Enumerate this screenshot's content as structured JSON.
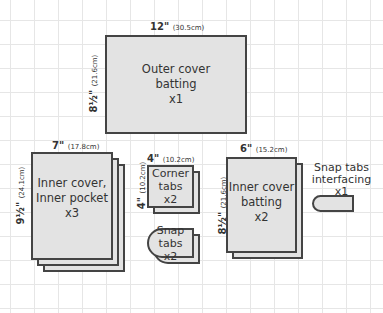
{
  "pieces": {
    "outer_cover": {
      "label_lines": [
        "Outer cover",
        "batting",
        "x1"
      ],
      "width": "12\"",
      "width_cm": "(30.5cm)",
      "height": "8½\"",
      "height_cm": "(21.6cm)"
    },
    "inner_cover": {
      "label_lines": [
        "Inner cover,",
        "Inner pocket",
        "x3"
      ],
      "width": "7\"",
      "width_cm": "(17.8cm)",
      "height": "9½\"",
      "height_cm": "(24.1cm)"
    },
    "corner_tabs": {
      "label_lines": [
        "Corner",
        "tabs",
        "x2"
      ],
      "width": "4\"",
      "width_cm": "(10.2cm)",
      "height": "4\"",
      "height_cm": "(10.2cm)"
    },
    "snap_tabs": {
      "label_lines": [
        "Snap tabs",
        "x2"
      ]
    },
    "inner_batting": {
      "label_lines": [
        "Inner cover",
        "batting",
        "x2"
      ],
      "width": "6\"",
      "width_cm": "(15.2cm)",
      "height": "8½\"",
      "height_cm": "(21.6cm)"
    },
    "snap_interfacing": {
      "label_lines": [
        "Snap tabs",
        "interfacing",
        "x1"
      ]
    }
  },
  "colors": {
    "fill": "#e3e3e3",
    "stroke": "#444444",
    "grid": "#e6e6e6"
  }
}
